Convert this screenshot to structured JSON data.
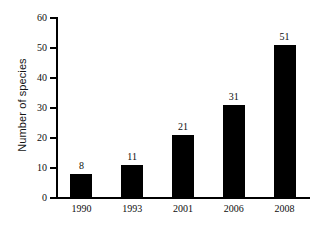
{
  "chart_data": {
    "type": "bar",
    "title": "",
    "xlabel": "",
    "ylabel": "Number of species",
    "categories": [
      "1990",
      "1993",
      "2001",
      "2006",
      "2008"
    ],
    "values": [
      8,
      11,
      21,
      31,
      51
    ],
    "value_labels": [
      "8",
      "11",
      "21",
      "31",
      "51"
    ],
    "ylim": [
      0,
      60
    ],
    "yticks": [
      0,
      10,
      20,
      30,
      40,
      50,
      60
    ],
    "ytick_labels": [
      "0",
      "10",
      "20",
      "30",
      "40",
      "50",
      "60"
    ],
    "grid": false,
    "legend": null,
    "bar_color": "#000000",
    "axis_color": "#000000",
    "background_color": "#ffffff"
  }
}
